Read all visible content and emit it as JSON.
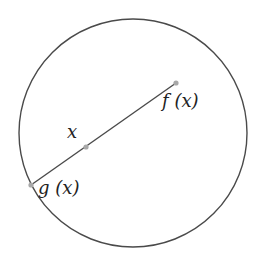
{
  "diagram": {
    "circle": {
      "cx": 133,
      "cy": 133,
      "r": 114,
      "stroke": "#4a4a4a"
    },
    "segment": {
      "from": "g",
      "to": "f",
      "stroke": "#4a4a4a"
    },
    "points": {
      "f": {
        "x": 176,
        "y": 83,
        "color": "#a8a8a8"
      },
      "x": {
        "x": 86,
        "y": 147,
        "color": "#a8a8a8"
      },
      "g": {
        "x": 31,
        "y": 185,
        "color": "#a8a8a8"
      }
    },
    "labels": {
      "f": "f (x)",
      "x": "x",
      "g": "g (x)"
    }
  }
}
